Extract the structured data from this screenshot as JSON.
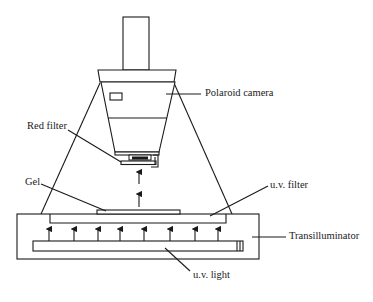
{
  "diagram": {
    "labels": {
      "polaroid_camera": "Polaroid camera",
      "red_filter": "Red filter",
      "gel": "Gel",
      "uv_filter": "u.v. filter",
      "transilluminator": "Transilluminator",
      "uv_light": "u.v. light"
    },
    "components": [
      {
        "id": "polaroid-camera",
        "label": "Polaroid camera"
      },
      {
        "id": "red-filter",
        "label": "Red filter"
      },
      {
        "id": "gel",
        "label": "Gel"
      },
      {
        "id": "uv-filter",
        "label": "u.v. filter"
      },
      {
        "id": "transilluminator",
        "label": "Transilluminator"
      },
      {
        "id": "uv-light",
        "label": "u.v. light"
      }
    ],
    "uv_arrow_count": 8,
    "light_path_arrow_count": 2,
    "colors": {
      "ink": "#1a1a1a",
      "background": "#ffffff"
    }
  }
}
